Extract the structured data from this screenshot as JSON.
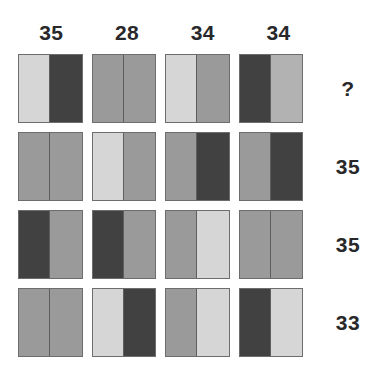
{
  "palette": {
    "light": "#d6d6d6",
    "medium_light": "#b2b2b2",
    "medium": "#9a9a9a",
    "dark": "#414141",
    "border": "#6d6d6d",
    "text": "#28282a",
    "background": "#ffffff"
  },
  "column_headers": [
    {
      "label": "35"
    },
    {
      "label": "28"
    },
    {
      "label": "34"
    },
    {
      "label": "34"
    }
  ],
  "row_labels": [
    {
      "label": "?"
    },
    {
      "label": "35"
    },
    {
      "label": "35"
    },
    {
      "label": "33"
    }
  ],
  "grid": {
    "rows": 4,
    "cols": 4,
    "cells": [
      [
        {
          "left": "light",
          "right": "dark"
        },
        {
          "left": "medium",
          "right": "medium"
        },
        {
          "left": "light",
          "right": "medium"
        },
        {
          "left": "dark",
          "right": "medium_light"
        }
      ],
      [
        {
          "left": "medium",
          "right": "medium"
        },
        {
          "left": "light",
          "right": "medium"
        },
        {
          "left": "medium",
          "right": "dark"
        },
        {
          "left": "medium",
          "right": "dark"
        }
      ],
      [
        {
          "left": "dark",
          "right": "medium"
        },
        {
          "left": "dark",
          "right": "medium"
        },
        {
          "left": "medium",
          "right": "light"
        },
        {
          "left": "medium",
          "right": "medium"
        }
      ],
      [
        {
          "left": "medium",
          "right": "medium"
        },
        {
          "left": "light",
          "right": "dark"
        },
        {
          "left": "medium",
          "right": "light"
        },
        {
          "left": "dark",
          "right": "light"
        }
      ]
    ]
  }
}
